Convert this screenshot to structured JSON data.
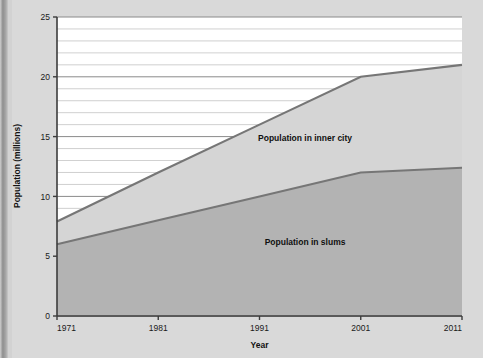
{
  "chart_data": {
    "type": "area",
    "title": "",
    "subtitle": "",
    "xlabel": "Year",
    "ylabel": "Population (millions)",
    "x": [
      1971,
      1981,
      1991,
      2001,
      2011
    ],
    "xtick_labels": [
      "1971",
      "1981",
      "1991",
      "2001",
      "2011"
    ],
    "ytick_labels": [
      "0",
      "5",
      "10",
      "15",
      "20",
      "25"
    ],
    "ytick_values": [
      0,
      5,
      10,
      15,
      20,
      25
    ],
    "ylim": [
      0,
      25
    ],
    "xlim": [
      1971,
      2011
    ],
    "grid": true,
    "minor_grid_step": 1,
    "major_grid_step": 5,
    "legend_position": "inline-annotations",
    "stacked": true,
    "series": [
      {
        "name": "Population in slums",
        "values": [
          6.0,
          8.0,
          10.0,
          12.0,
          12.4
        ],
        "color": "#b3b3b3",
        "line_color": "#767676"
      },
      {
        "name": "Population in inner city",
        "values": [
          1.9,
          4.0,
          6.0,
          8.0,
          8.6
        ],
        "cumulative_top": [
          7.9,
          12.0,
          16.0,
          20.0,
          21.0
        ],
        "color": "#d5d5d5",
        "line_color": "#767676"
      }
    ],
    "annotations": [
      {
        "text": "Population in inner city",
        "x": 1995.5,
        "y": 14.6
      },
      {
        "text": "Population in slums",
        "x": 1995.5,
        "y": 5.9
      }
    ]
  },
  "colors": {
    "page_background": "#d9d9d9",
    "plot_background": "#ffffff",
    "axis": "#3c3c3c",
    "major_gridline": "#8a8a8a",
    "minor_gridline": "#c4c4c4",
    "slums_fill": "#b3b3b3",
    "inner_city_fill": "#d5d5d5",
    "series_line": "#767676",
    "text": "#111111"
  }
}
